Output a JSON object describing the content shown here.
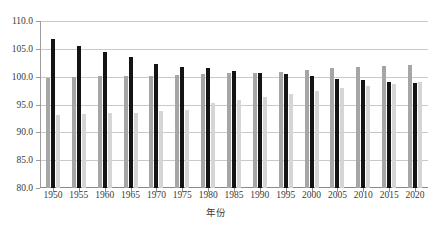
{
  "chart_data": {
    "type": "bar",
    "title": "",
    "xlabel": "年份",
    "ylabel": "",
    "ylim": [
      80.0,
      110.0
    ],
    "ytick_step": 5.0,
    "ytick_labels": [
      "110.0",
      "105.0",
      "100.0",
      "95.0",
      "90.0",
      "85.0",
      "80.0"
    ],
    "ytick_values": [
      110.0,
      105.0,
      100.0,
      95.0,
      90.0,
      85.0,
      80.0
    ],
    "grid": "horizontal",
    "legend": "none",
    "categories": [
      "1950",
      "1955",
      "1960",
      "1965",
      "1970",
      "1975",
      "1980",
      "1985",
      "1990",
      "1995",
      "2000",
      "2005",
      "2010",
      "2015",
      "2020"
    ],
    "series": [
      {
        "name": "series-1",
        "color": "#a6a6a6",
        "values": [
          99.8,
          100.0,
          100.1,
          100.1,
          100.2,
          100.3,
          100.5,
          100.6,
          100.7,
          100.9,
          101.2,
          101.5,
          101.8,
          102.0,
          102.1
        ]
      },
      {
        "name": "series-2",
        "color": "#141414",
        "values": [
          106.7,
          105.6,
          104.4,
          103.5,
          102.2,
          101.7,
          101.6,
          101.0,
          100.7,
          100.5,
          100.1,
          99.6,
          99.4,
          99.1,
          98.9
        ]
      },
      {
        "name": "series-3",
        "color": "#d5d5d5",
        "values": [
          93.1,
          93.3,
          93.4,
          93.5,
          93.9,
          94.0,
          95.2,
          95.8,
          96.3,
          96.8,
          97.4,
          97.9,
          98.3,
          98.7,
          99.0
        ]
      }
    ]
  }
}
